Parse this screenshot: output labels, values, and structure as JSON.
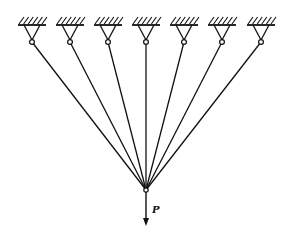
{
  "diagram": {
    "type": "statics-bar-system",
    "support_count": 7,
    "supports_x": [
      32,
      70,
      108,
      146,
      184,
      222,
      261
    ],
    "support_y": 25,
    "pin_y": 42,
    "node": {
      "x": 146,
      "y": 190
    },
    "load": {
      "label": "P",
      "direction": "down",
      "end_y": 226
    },
    "colors": {
      "stroke": "#111111",
      "background": "#ffffff"
    }
  }
}
